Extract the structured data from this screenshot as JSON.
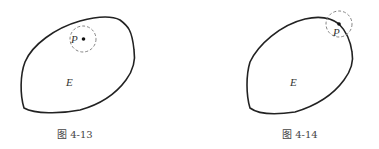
{
  "figures": [
    {
      "caption": "图 4-13",
      "region_label": "E",
      "point_label": "P",
      "description": "Point P inside region E with a dashed neighborhood circle fully inside E"
    },
    {
      "caption": "图 4-14",
      "region_label": "E",
      "point_label": "P",
      "description": "Point P on boundary of region E with dashed neighborhood circle crossing the boundary"
    }
  ],
  "colors": {
    "stroke": "#222222",
    "dashed": "#777777",
    "text": "#444444"
  }
}
